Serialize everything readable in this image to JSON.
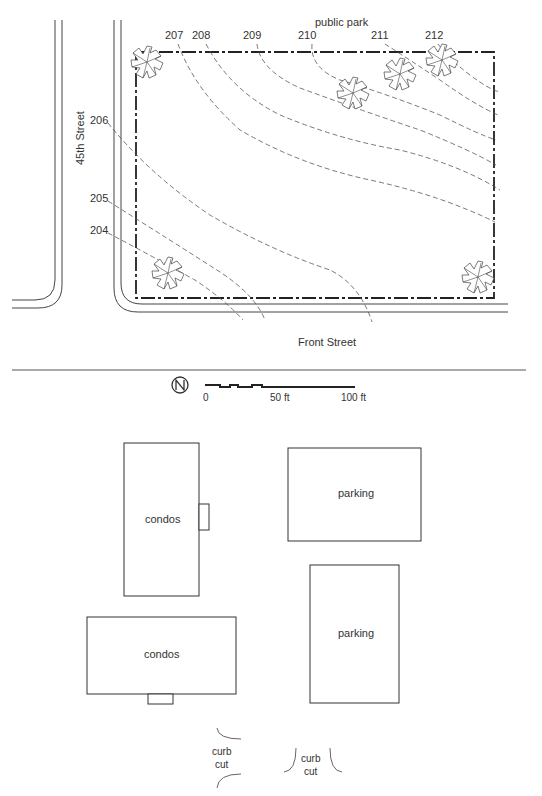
{
  "site_plan": {
    "street_labels": {
      "west": "45th Street",
      "south": "Front Street",
      "north": "public park"
    },
    "contour_labels": [
      {
        "value": "207",
        "x": 173,
        "y": 39
      },
      {
        "value": "208",
        "x": 200,
        "y": 39
      },
      {
        "value": "209",
        "x": 251,
        "y": 39
      },
      {
        "value": "210",
        "x": 306,
        "y": 39
      },
      {
        "value": "211",
        "x": 379,
        "y": 39
      },
      {
        "value": "212",
        "x": 433,
        "y": 39
      },
      {
        "value": "206",
        "x": 100,
        "y": 123
      },
      {
        "value": "205",
        "x": 100,
        "y": 201
      },
      {
        "value": "204",
        "x": 100,
        "y": 233
      }
    ],
    "scale_bar": {
      "labels": [
        "0",
        "50 ft",
        "100 ft"
      ],
      "north_arrow": "north-arrow-icon"
    }
  },
  "layout_plan": {
    "buildings": [
      {
        "id": "condos-1",
        "label": "condos"
      },
      {
        "id": "parking-1",
        "label": "parking"
      },
      {
        "id": "condos-2",
        "label": "condos"
      },
      {
        "id": "parking-2",
        "label": "parking"
      }
    ],
    "curb_cuts": [
      {
        "label_line1": "curb",
        "label_line2": "cut"
      },
      {
        "label_line1": "curb",
        "label_line2": "cut"
      }
    ]
  }
}
